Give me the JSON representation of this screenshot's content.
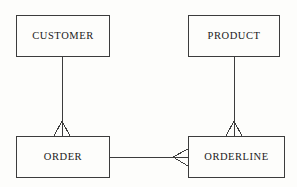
{
  "diagram": {
    "notation": "crow's foot",
    "background_color": "#fdfdfb",
    "line_color": "#3c3c3c",
    "text_color": "#1a1a1a",
    "entities": [
      {
        "id": "customer",
        "label": "CUSTOMER",
        "x": 16,
        "y": 15,
        "width": 94,
        "height": 42
      },
      {
        "id": "product",
        "label": "PRODUCT",
        "x": 188,
        "y": 15,
        "width": 92,
        "height": 42
      },
      {
        "id": "order",
        "label": "ORDER",
        "x": 16,
        "y": 136,
        "width": 94,
        "height": 42
      },
      {
        "id": "orderline",
        "label": "ORDERLINE",
        "x": 188,
        "y": 136,
        "width": 97,
        "height": 42
      }
    ],
    "relationships": [
      {
        "id": "customer-order",
        "from": "customer",
        "to": "order",
        "orientation": "vertical",
        "crow_foot_at": "order",
        "line": {
          "x1": 62,
          "y1": 57,
          "x2": 62,
          "y2": 121
        },
        "crow_foot": {
          "apex_x": 62,
          "apex_y": 121,
          "left_x": 54,
          "right_x": 70,
          "base_y": 136
        }
      },
      {
        "id": "product-orderline",
        "from": "product",
        "to": "orderline",
        "orientation": "vertical",
        "crow_foot_at": "orderline",
        "line": {
          "x1": 234,
          "y1": 57,
          "x2": 234,
          "y2": 121
        },
        "crow_foot": {
          "apex_x": 234,
          "apex_y": 121,
          "left_x": 226,
          "right_x": 242,
          "base_y": 136
        }
      },
      {
        "id": "order-orderline",
        "from": "order",
        "to": "orderline",
        "orientation": "horizontal",
        "crow_foot_at": "orderline",
        "line": {
          "x1": 110,
          "y1": 157,
          "x2": 173,
          "y2": 157
        },
        "crow_foot": {
          "apex_x": 173,
          "apex_y": 157,
          "top_y": 149,
          "bottom_y": 166,
          "base_x": 188
        }
      }
    ]
  }
}
